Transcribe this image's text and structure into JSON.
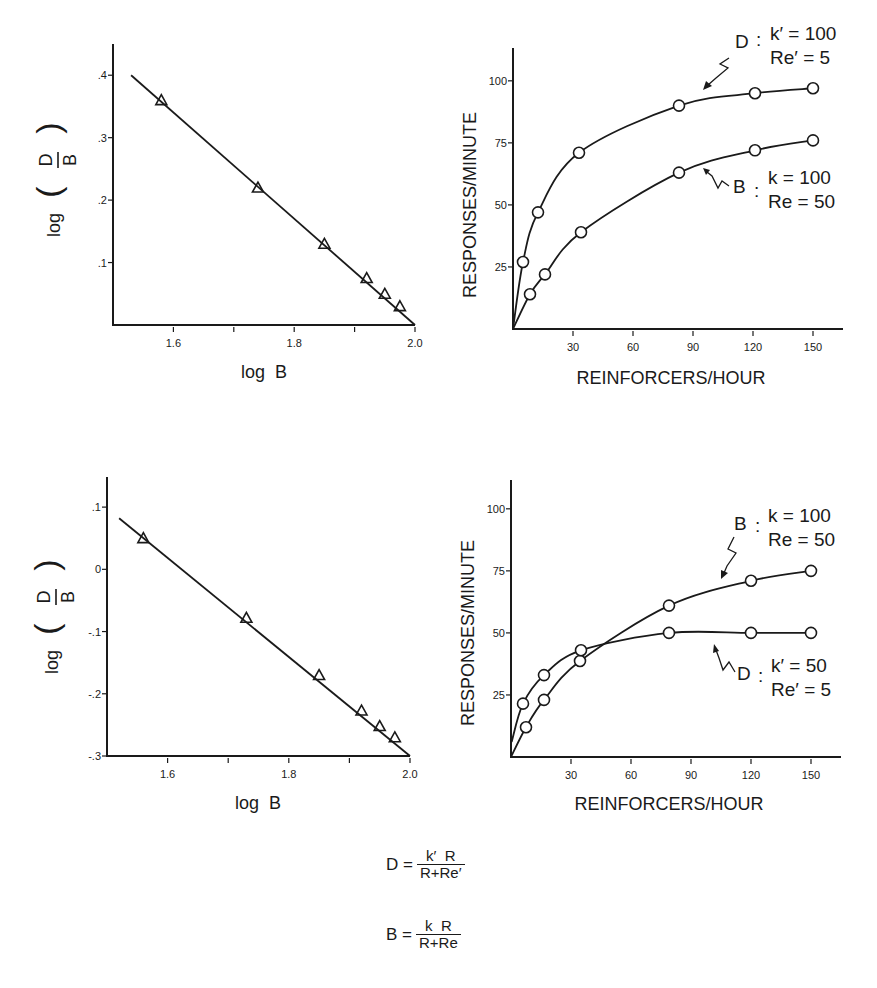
{
  "chart_data": [
    {
      "id": "log-top",
      "type": "line",
      "xlabel": "log  B",
      "ylabel_prefix": "log",
      "ylabel_num": "D",
      "ylabel_den": "B",
      "xlim": [
        1.5,
        2.0
      ],
      "ylim": [
        0,
        0.45
      ],
      "xticks": [
        1.6,
        1.7,
        1.8,
        1.9,
        2.0
      ],
      "xtick_labels": [
        "1.6",
        "",
        "1.8",
        "",
        "2.0"
      ],
      "yticks": [
        0.1,
        0.2,
        0.3,
        0.4
      ],
      "ytick_labels": [
        ".1",
        ".2",
        ".3",
        ".4"
      ],
      "grid": false,
      "series": [
        {
          "name": "observed",
          "marker": "triangle",
          "x": [
            1.58,
            1.74,
            1.85,
            1.92,
            1.95,
            1.975
          ],
          "y": [
            0.36,
            0.22,
            0.13,
            0.075,
            0.05,
            0.03
          ]
        },
        {
          "name": "fit",
          "marker": "none",
          "x": [
            1.53,
            2.0
          ],
          "y": [
            0.4,
            0.0
          ]
        }
      ]
    },
    {
      "id": "resp-top",
      "type": "line",
      "xlabel": "REINFORCERS/HOUR",
      "ylabel": "RESPONSES/MINUTE",
      "xlim": [
        0,
        165
      ],
      "ylim": [
        0,
        110
      ],
      "xticks": [
        30,
        60,
        90,
        120,
        150
      ],
      "xtick_labels": [
        "30",
        "60",
        "90",
        "120",
        "150"
      ],
      "yticks": [
        25,
        50,
        75,
        100
      ],
      "ytick_labels": [
        "25",
        "50",
        "75",
        "100"
      ],
      "grid": false,
      "series": [
        {
          "name": "D",
          "params": {
            "k": 100,
            "Re": 5
          },
          "label_lines": [
            "k′ = 100",
            "Re′ = 5"
          ],
          "marker": "circle",
          "x": [
            5,
            12.5,
            33,
            83,
            121,
            150
          ],
          "y": [
            27,
            47,
            71,
            90,
            95,
            97
          ]
        },
        {
          "name": "B",
          "params": {
            "k": 100,
            "Re": 50
          },
          "label_lines": [
            "k = 100",
            "Re = 50"
          ],
          "marker": "circle",
          "x": [
            8.5,
            16,
            34,
            83,
            121,
            150
          ],
          "y": [
            14,
            22,
            39,
            63,
            72,
            76
          ]
        }
      ]
    },
    {
      "id": "log-bottom",
      "type": "line",
      "xlabel": "log  B",
      "ylabel_prefix": "log",
      "ylabel_num": "D",
      "ylabel_den": "B",
      "xlim": [
        1.5,
        2.0
      ],
      "ylim": [
        -0.3,
        0.15
      ],
      "xticks": [
        1.6,
        1.7,
        1.8,
        1.9,
        2.0
      ],
      "xtick_labels": [
        "1.6",
        "",
        "1.8",
        "",
        "2.0"
      ],
      "yticks": [
        -0.3,
        -0.2,
        -0.1,
        0,
        0.1
      ],
      "ytick_labels": [
        "-.3",
        "-.2",
        "-.1",
        "0",
        ".1"
      ],
      "grid": false,
      "series": [
        {
          "name": "observed",
          "marker": "triangle",
          "x": [
            1.56,
            1.73,
            1.85,
            1.92,
            1.95,
            1.975
          ],
          "y": [
            0.05,
            -0.078,
            -0.17,
            -0.227,
            -0.252,
            -0.27
          ]
        },
        {
          "name": "fit",
          "marker": "none",
          "x": [
            1.52,
            2.0
          ],
          "y": [
            0.082,
            -0.3
          ]
        }
      ]
    },
    {
      "id": "resp-bottom",
      "type": "line",
      "xlabel": "REINFORCERS/HOUR",
      "ylabel": "RESPONSES/MINUTE",
      "xlim": [
        0,
        165
      ],
      "ylim": [
        0,
        110
      ],
      "xticks": [
        30,
        60,
        90,
        120,
        150
      ],
      "xtick_labels": [
        "30",
        "60",
        "90",
        "120",
        "150"
      ],
      "yticks": [
        25,
        50,
        75,
        100
      ],
      "ytick_labels": [
        "25",
        "50",
        "75",
        "100"
      ],
      "grid": false,
      "series": [
        {
          "name": "B",
          "params": {
            "k": 100,
            "Re": 50
          },
          "label_lines": [
            "k = 100",
            "Re = 50"
          ],
          "marker": "circle",
          "x": [
            7.5,
            16.5,
            34.5,
            79,
            120,
            150
          ],
          "y": [
            12,
            23,
            38.7,
            61,
            71,
            75
          ]
        },
        {
          "name": "D",
          "params": {
            "k": 50,
            "Re": 5
          },
          "label_lines": [
            "k′ = 50",
            "Re′ = 5"
          ],
          "marker": "circle",
          "x": [
            6,
            16.5,
            35,
            79,
            120,
            150
          ],
          "y": [
            21.5,
            33,
            43,
            50,
            50,
            50
          ]
        }
      ]
    }
  ],
  "equations": {
    "D": {
      "lhs": "D =",
      "num": "k′  R",
      "den": "R+Re′"
    },
    "B": {
      "lhs": "B =",
      "num": "k  R",
      "den": "R+Re"
    }
  },
  "annotations": {
    "top": {
      "D_name": "D",
      "B_name": "B"
    },
    "bottom": {
      "D_name": "D",
      "B_name": "B"
    }
  }
}
